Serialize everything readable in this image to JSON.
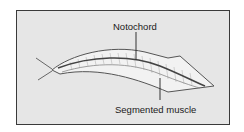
{
  "diagram": {
    "labels": {
      "notochord": "Notochord",
      "segmented_muscle": "Segmented muscle"
    },
    "colors": {
      "background": "#e6e6e6",
      "border": "#3a3a3a",
      "body_fill": "#f2f2f2",
      "outline": "#555555",
      "notochord": "#444444"
    }
  }
}
